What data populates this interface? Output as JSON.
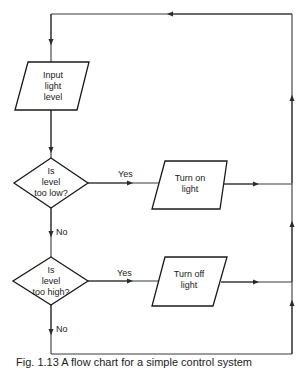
{
  "diagram": {
    "type": "flowchart",
    "nodes": [
      {
        "id": "input",
        "shape": "parallelogram",
        "lines": [
          "Input",
          "light",
          "level"
        ]
      },
      {
        "id": "low",
        "shape": "diamond",
        "lines": [
          "Is",
          "level",
          "too low?"
        ]
      },
      {
        "id": "on",
        "shape": "parallelogram",
        "lines": [
          "Turn on",
          "light"
        ]
      },
      {
        "id": "high",
        "shape": "diamond",
        "lines": [
          "Is",
          "level",
          "too high?"
        ]
      },
      {
        "id": "off",
        "shape": "parallelogram",
        "lines": [
          "Turn off",
          "light"
        ]
      }
    ],
    "edges": [
      {
        "from": "loop-top",
        "to": "input",
        "label": ""
      },
      {
        "from": "input",
        "to": "low",
        "label": ""
      },
      {
        "from": "low",
        "to": "on",
        "label": "Yes"
      },
      {
        "from": "low",
        "to": "high",
        "label": "No"
      },
      {
        "from": "high",
        "to": "off",
        "label": "Yes"
      },
      {
        "from": "high",
        "to": "loop-bottom",
        "label": "No"
      },
      {
        "from": "on",
        "to": "loop-right",
        "label": ""
      },
      {
        "from": "off",
        "to": "loop-right",
        "label": ""
      },
      {
        "from": "loop-right",
        "to": "loop-top",
        "label": ""
      }
    ],
    "labels": {
      "yes1": "Yes",
      "no1": "No",
      "yes2": "Yes",
      "no2": "No"
    }
  },
  "caption": "Fig. 1.13  A flow chart for a simple control system"
}
